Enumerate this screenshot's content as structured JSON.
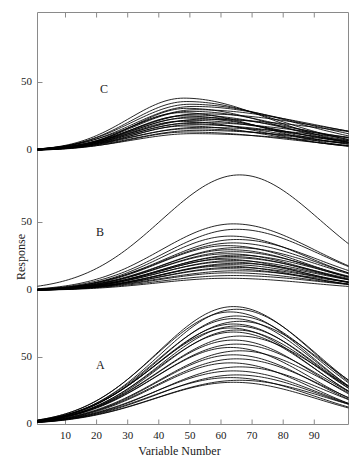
{
  "figure": {
    "background": "#ffffff",
    "line_color": "#000000",
    "axis_color": "#8a8a8a",
    "width": 359,
    "height": 464
  },
  "axes": {
    "x_title": "Variable Number",
    "y_title": "Response",
    "x_ticks": [
      10,
      20,
      30,
      40,
      50,
      60,
      70,
      80,
      90
    ],
    "x_tick_labels": [
      "10",
      "20",
      "30",
      "40",
      "50",
      "60",
      "70",
      "80",
      "90"
    ],
    "x_range": [
      1,
      101
    ],
    "y_tick_labels_per_panel": [
      "0",
      "50"
    ],
    "panel_y_range": [
      -8,
      100
    ]
  },
  "panels": [
    {
      "letter": "C",
      "label_x": 100,
      "label_y": 82
    },
    {
      "letter": "B",
      "label_x": 96,
      "label_y": 225
    },
    {
      "letter": "A",
      "label_x": 96,
      "label_y": 358
    }
  ],
  "chart_data": {
    "type": "line",
    "title": "",
    "xlabel": "Variable Number",
    "ylabel": "Response",
    "xlim": [
      1,
      101
    ],
    "grid": false,
    "legend": null,
    "panels": [
      {
        "name": "C",
        "ylim": [
          -8,
          100
        ],
        "yticks": [
          0,
          50
        ],
        "peak_x_range": [
          46,
          58
        ],
        "peak_y_range": [
          12,
          40
        ],
        "series": [
          {
            "name": "C1",
            "peak_x": 48,
            "peak_y": 38.5,
            "width": 23,
            "skew": 0.42,
            "tail": 1.2
          },
          {
            "name": "C2",
            "peak_x": 49,
            "peak_y": 36.0,
            "width": 23,
            "skew": 0.4,
            "tail": 1.3
          },
          {
            "name": "C3",
            "peak_x": 50,
            "peak_y": 34.0,
            "width": 24,
            "skew": 0.4,
            "tail": 1.4
          },
          {
            "name": "C4",
            "peak_x": 51,
            "peak_y": 32.4,
            "width": 24,
            "skew": 0.38,
            "tail": 1.5
          },
          {
            "name": "C5",
            "peak_x": 49,
            "peak_y": 31.0,
            "width": 22,
            "skew": 0.44,
            "tail": 1.3
          },
          {
            "name": "C6",
            "peak_x": 52,
            "peak_y": 30.0,
            "width": 25,
            "skew": 0.36,
            "tail": 1.6
          },
          {
            "name": "C7",
            "peak_x": 50,
            "peak_y": 28.8,
            "width": 23,
            "skew": 0.4,
            "tail": 1.4
          },
          {
            "name": "C8",
            "peak_x": 47,
            "peak_y": 27.8,
            "width": 22,
            "skew": 0.46,
            "tail": 1.2
          },
          {
            "name": "C9",
            "peak_x": 53,
            "peak_y": 27.0,
            "width": 25,
            "skew": 0.34,
            "tail": 1.7
          },
          {
            "name": "C10",
            "peak_x": 50,
            "peak_y": 26.2,
            "width": 23,
            "skew": 0.4,
            "tail": 1.4
          },
          {
            "name": "C11",
            "peak_x": 48,
            "peak_y": 25.4,
            "width": 22,
            "skew": 0.44,
            "tail": 1.3
          },
          {
            "name": "C12",
            "peak_x": 51,
            "peak_y": 24.6,
            "width": 24,
            "skew": 0.38,
            "tail": 1.5
          },
          {
            "name": "C13",
            "peak_x": 49,
            "peak_y": 23.8,
            "width": 23,
            "skew": 0.42,
            "tail": 1.35
          },
          {
            "name": "C14",
            "peak_x": 54,
            "peak_y": 23.0,
            "width": 26,
            "skew": 0.32,
            "tail": 1.8
          },
          {
            "name": "C15",
            "peak_x": 50,
            "peak_y": 22.2,
            "width": 23,
            "skew": 0.4,
            "tail": 1.4
          },
          {
            "name": "C16",
            "peak_x": 47,
            "peak_y": 21.4,
            "width": 22,
            "skew": 0.46,
            "tail": 1.25
          },
          {
            "name": "C17",
            "peak_x": 52,
            "peak_y": 20.6,
            "width": 25,
            "skew": 0.36,
            "tail": 1.6
          },
          {
            "name": "C18",
            "peak_x": 49,
            "peak_y": 19.8,
            "width": 23,
            "skew": 0.42,
            "tail": 1.35
          },
          {
            "name": "C19",
            "peak_x": 51,
            "peak_y": 19.0,
            "width": 24,
            "skew": 0.38,
            "tail": 1.5
          },
          {
            "name": "C20",
            "peak_x": 48,
            "peak_y": 18.0,
            "width": 22,
            "skew": 0.44,
            "tail": 1.3
          },
          {
            "name": "C21",
            "peak_x": 53,
            "peak_y": 17.0,
            "width": 26,
            "skew": 0.34,
            "tail": 1.7
          },
          {
            "name": "C22",
            "peak_x": 50,
            "peak_y": 16.0,
            "width": 24,
            "skew": 0.4,
            "tail": 1.45
          },
          {
            "name": "C23",
            "peak_x": 52,
            "peak_y": 14.8,
            "width": 25,
            "skew": 0.36,
            "tail": 1.6
          },
          {
            "name": "C24",
            "peak_x": 49,
            "peak_y": 13.6,
            "width": 23,
            "skew": 0.42,
            "tail": 1.4
          },
          {
            "name": "C25",
            "peak_x": 51,
            "peak_y": 12.4,
            "width": 25,
            "skew": 0.38,
            "tail": 1.55
          }
        ]
      },
      {
        "name": "B",
        "ylim": [
          -8,
          100
        ],
        "yticks": [
          0,
          50
        ],
        "peak_x_range": [
          58,
          70
        ],
        "peak_y_range": [
          8,
          86
        ],
        "series": [
          {
            "name": "B-outlier",
            "peak_x": 66,
            "peak_y": 85.0,
            "width": 26,
            "skew": 0.05,
            "tail": 1.0
          },
          {
            "name": "B1",
            "peak_x": 64,
            "peak_y": 49.0,
            "width": 25,
            "skew": 0.12,
            "tail": 1.05
          },
          {
            "name": "B2",
            "peak_x": 65,
            "peak_y": 45.0,
            "width": 25,
            "skew": 0.12,
            "tail": 1.05
          },
          {
            "name": "B3",
            "peak_x": 63,
            "peak_y": 40.0,
            "width": 24,
            "skew": 0.14,
            "tail": 1.05
          },
          {
            "name": "B4",
            "peak_x": 65,
            "peak_y": 37.5,
            "width": 25,
            "skew": 0.12,
            "tail": 1.05
          },
          {
            "name": "B5",
            "peak_x": 64,
            "peak_y": 35.0,
            "width": 25,
            "skew": 0.13,
            "tail": 1.05
          },
          {
            "name": "B6",
            "peak_x": 62,
            "peak_y": 33.0,
            "width": 24,
            "skew": 0.15,
            "tail": 1.05
          },
          {
            "name": "B7",
            "peak_x": 65,
            "peak_y": 31.5,
            "width": 25,
            "skew": 0.12,
            "tail": 1.05
          },
          {
            "name": "B8",
            "peak_x": 63,
            "peak_y": 30.0,
            "width": 24,
            "skew": 0.14,
            "tail": 1.05
          },
          {
            "name": "B9",
            "peak_x": 64,
            "peak_y": 28.5,
            "width": 25,
            "skew": 0.13,
            "tail": 1.05
          },
          {
            "name": "B10",
            "peak_x": 62,
            "peak_y": 27.0,
            "width": 24,
            "skew": 0.15,
            "tail": 1.05
          },
          {
            "name": "B11",
            "peak_x": 65,
            "peak_y": 26.0,
            "width": 25,
            "skew": 0.12,
            "tail": 1.05
          },
          {
            "name": "B12",
            "peak_x": 63,
            "peak_y": 25.0,
            "width": 24,
            "skew": 0.14,
            "tail": 1.05
          },
          {
            "name": "B13",
            "peak_x": 64,
            "peak_y": 24.0,
            "width": 25,
            "skew": 0.13,
            "tail": 1.05
          },
          {
            "name": "B14",
            "peak_x": 61,
            "peak_y": 23.0,
            "width": 23,
            "skew": 0.16,
            "tail": 1.05
          },
          {
            "name": "B15",
            "peak_x": 64,
            "peak_y": 22.0,
            "width": 25,
            "skew": 0.13,
            "tail": 1.05
          },
          {
            "name": "B16",
            "peak_x": 62,
            "peak_y": 21.0,
            "width": 24,
            "skew": 0.15,
            "tail": 1.05
          },
          {
            "name": "B17",
            "peak_x": 65,
            "peak_y": 20.0,
            "width": 25,
            "skew": 0.12,
            "tail": 1.05
          },
          {
            "name": "B18",
            "peak_x": 63,
            "peak_y": 19.0,
            "width": 24,
            "skew": 0.14,
            "tail": 1.05
          },
          {
            "name": "B19",
            "peak_x": 61,
            "peak_y": 18.0,
            "width": 23,
            "skew": 0.16,
            "tail": 1.05
          },
          {
            "name": "B20",
            "peak_x": 64,
            "peak_y": 17.0,
            "width": 25,
            "skew": 0.13,
            "tail": 1.05
          },
          {
            "name": "B21",
            "peak_x": 62,
            "peak_y": 16.0,
            "width": 24,
            "skew": 0.15,
            "tail": 1.05
          },
          {
            "name": "B22",
            "peak_x": 65,
            "peak_y": 14.5,
            "width": 26,
            "skew": 0.12,
            "tail": 1.05
          },
          {
            "name": "B23",
            "peak_x": 63,
            "peak_y": 13.0,
            "width": 25,
            "skew": 0.14,
            "tail": 1.05
          },
          {
            "name": "B24",
            "peak_x": 64,
            "peak_y": 11.0,
            "width": 26,
            "skew": 0.13,
            "tail": 1.05
          },
          {
            "name": "B25",
            "peak_x": 62,
            "peak_y": 9.0,
            "width": 25,
            "skew": 0.15,
            "tail": 1.05
          }
        ]
      },
      {
        "name": "A",
        "ylim": [
          -8,
          100
        ],
        "yticks": [
          0,
          50
        ],
        "peak_x_range": [
          60,
          70
        ],
        "peak_y_range": [
          30,
          88
        ],
        "series": [
          {
            "name": "A1",
            "peak_x": 64,
            "peak_y": 88.0,
            "width": 26,
            "skew": 0.1,
            "tail": 1.0
          },
          {
            "name": "A2",
            "peak_x": 65,
            "peak_y": 86.0,
            "width": 26,
            "skew": 0.1,
            "tail": 1.0
          },
          {
            "name": "A3",
            "peak_x": 63,
            "peak_y": 84.0,
            "width": 26,
            "skew": 0.11,
            "tail": 1.0
          },
          {
            "name": "A4",
            "peak_x": 65,
            "peak_y": 81.0,
            "width": 26,
            "skew": 0.1,
            "tail": 1.0
          },
          {
            "name": "A5",
            "peak_x": 64,
            "peak_y": 79.0,
            "width": 26,
            "skew": 0.1,
            "tail": 1.0
          },
          {
            "name": "A6",
            "peak_x": 66,
            "peak_y": 77.0,
            "width": 27,
            "skew": 0.09,
            "tail": 1.0
          },
          {
            "name": "A7",
            "peak_x": 64,
            "peak_y": 75.0,
            "width": 26,
            "skew": 0.1,
            "tail": 1.0
          },
          {
            "name": "A8",
            "peak_x": 65,
            "peak_y": 73.5,
            "width": 26,
            "skew": 0.1,
            "tail": 1.0
          },
          {
            "name": "A9",
            "peak_x": 63,
            "peak_y": 72.0,
            "width": 26,
            "skew": 0.11,
            "tail": 1.0
          },
          {
            "name": "A10",
            "peak_x": 65,
            "peak_y": 70.5,
            "width": 26,
            "skew": 0.1,
            "tail": 1.0
          },
          {
            "name": "A11",
            "peak_x": 64,
            "peak_y": 69.0,
            "width": 26,
            "skew": 0.1,
            "tail": 1.0
          },
          {
            "name": "A12",
            "peak_x": 66,
            "peak_y": 66.0,
            "width": 27,
            "skew": 0.09,
            "tail": 1.0
          },
          {
            "name": "A13",
            "peak_x": 64,
            "peak_y": 63.0,
            "width": 26,
            "skew": 0.1,
            "tail": 1.0
          },
          {
            "name": "A14",
            "peak_x": 65,
            "peak_y": 60.0,
            "width": 27,
            "skew": 0.1,
            "tail": 1.0
          },
          {
            "name": "A15",
            "peak_x": 63,
            "peak_y": 57.5,
            "width": 26,
            "skew": 0.11,
            "tail": 1.0
          },
          {
            "name": "A16",
            "peak_x": 66,
            "peak_y": 55.0,
            "width": 27,
            "skew": 0.09,
            "tail": 1.0
          },
          {
            "name": "A17",
            "peak_x": 64,
            "peak_y": 52.0,
            "width": 26,
            "skew": 0.1,
            "tail": 1.0
          },
          {
            "name": "A18",
            "peak_x": 65,
            "peak_y": 49.0,
            "width": 27,
            "skew": 0.1,
            "tail": 1.0
          },
          {
            "name": "A19",
            "peak_x": 63,
            "peak_y": 46.0,
            "width": 26,
            "skew": 0.11,
            "tail": 1.0
          },
          {
            "name": "A20",
            "peak_x": 66,
            "peak_y": 43.0,
            "width": 27,
            "skew": 0.09,
            "tail": 1.0
          },
          {
            "name": "A21",
            "peak_x": 64,
            "peak_y": 40.0,
            "width": 27,
            "skew": 0.1,
            "tail": 1.0
          },
          {
            "name": "A22",
            "peak_x": 65,
            "peak_y": 37.0,
            "width": 27,
            "skew": 0.1,
            "tail": 1.0
          },
          {
            "name": "A23",
            "peak_x": 63,
            "peak_y": 35.0,
            "width": 27,
            "skew": 0.11,
            "tail": 1.0
          },
          {
            "name": "A24",
            "peak_x": 66,
            "peak_y": 33.0,
            "width": 28,
            "skew": 0.09,
            "tail": 1.0
          },
          {
            "name": "A25",
            "peak_x": 64,
            "peak_y": 31.5,
            "width": 27,
            "skew": 0.1,
            "tail": 1.0
          }
        ]
      }
    ]
  }
}
